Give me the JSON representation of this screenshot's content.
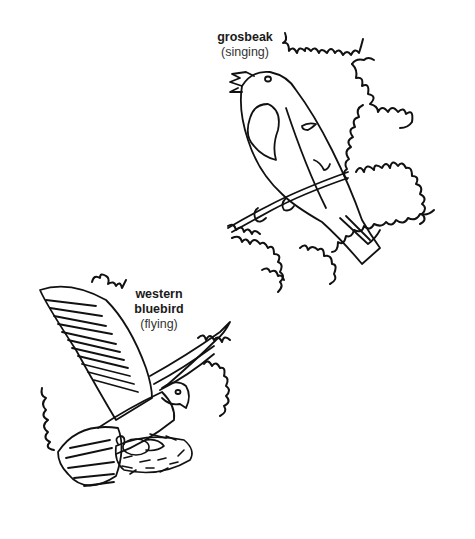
{
  "illustration": {
    "style": "coloring-book line art",
    "background_color": "#ffffff",
    "line_color": "#111111"
  },
  "birds": [
    {
      "name": "grosbeak",
      "action": "(singing)",
      "pose": "perched on twig, beak open"
    },
    {
      "name_line1": "western",
      "name_line2": "bluebird",
      "action": "(flying)",
      "pose": "wings spread, landing at nest with eggs"
    }
  ]
}
